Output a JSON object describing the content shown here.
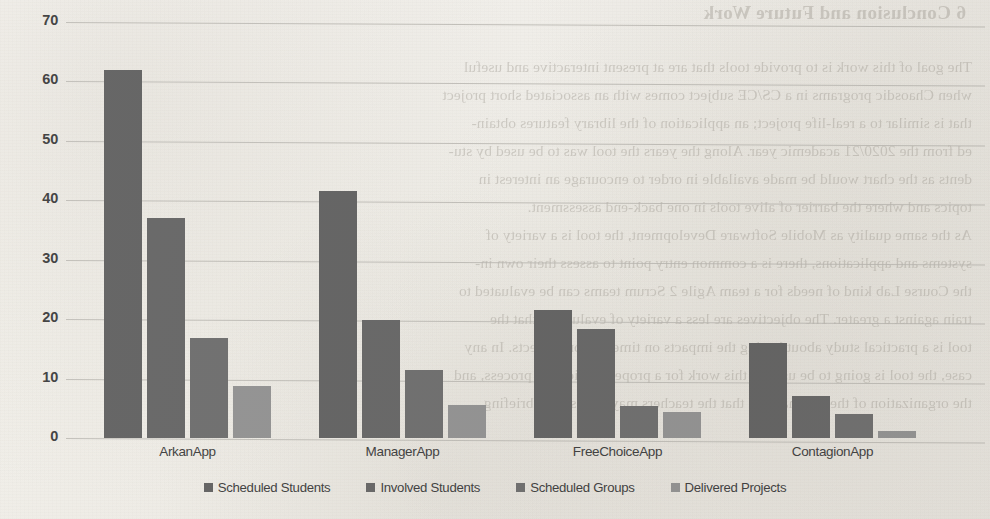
{
  "chart_data": {
    "type": "bar",
    "title": "",
    "xlabel": "",
    "ylabel": "",
    "categories": [
      "ArkanApp",
      "ManagerApp",
      "FreeChoiceApp",
      "ContagionApp"
    ],
    "series": [
      {
        "name": "Scheduled Students",
        "color": "#5f5f5f",
        "values": [
          62,
          41.5,
          21.5,
          16
        ]
      },
      {
        "name": "Involved Students",
        "color": "#636363",
        "values": [
          37,
          19.8,
          18.3,
          7
        ]
      },
      {
        "name": "Scheduled Groups",
        "color": "#6b6b6b",
        "values": [
          16.8,
          11.5,
          5.4,
          4
        ]
      },
      {
        "name": "Delivered Projects",
        "color": "#909090",
        "values": [
          8.8,
          5.5,
          4.3,
          1.2
        ]
      }
    ],
    "ylim": [
      0,
      70
    ],
    "yticks": [
      0,
      10,
      20,
      30,
      40,
      50,
      60,
      70
    ],
    "ytick_labels": [
      "0",
      "10",
      "20",
      "30",
      "40",
      "50",
      "60",
      "70"
    ],
    "grid": true,
    "legend_position": "bottom"
  },
  "bleed_text": {
    "lines": [
      "6   Conclusion and Future Work",
      "The goal of this work is to provide tools that are at present interactive and useful",
      "when Chaosdic programs in a CS/CE subject comes with an associated short project",
      "that is similar to a real-life project; an application of the library features obtain-",
      "ed from the 2020/21 academic year. Along the years the tool was to be used by stu-",
      "dents as the chart would be made available in order to encourage an interest in",
      "topics and where the barrier of alive tools in one back-end assessment.",
      "As the same quality as Mobile Software Development, the tool is a variety of",
      "systems and applications, there is a common entry point to assess their own in-",
      "the Course Lab kind of needs for a team Agile 2 Scrum teams can be evaluated to",
      "train against a greater. The objectives are less a variety of evaluation that the",
      "tool is a practical study about having the impacts on time and on projects. In any",
      "case, the tool is going to be used in this work for a proper application process, and",
      "the organization of the seminars, so that the teachers may choose a debriefing"
    ]
  }
}
